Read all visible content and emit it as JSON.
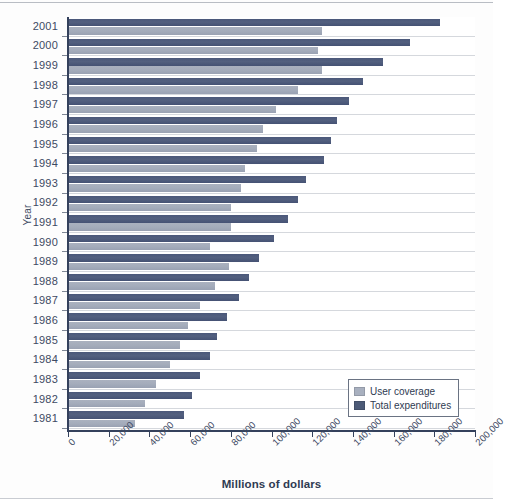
{
  "chart_data": {
    "type": "bar",
    "orientation": "horizontal",
    "title": "",
    "subtitle": "",
    "xlabel": "Millions of dollars",
    "ylabel": "Year",
    "xlim": [
      0,
      200000
    ],
    "ylim": null,
    "xticks": [
      0,
      20000,
      40000,
      60000,
      80000,
      100000,
      120000,
      140000,
      160000,
      180000,
      200000
    ],
    "xtick_labels": [
      "0",
      "20,000",
      "40,000",
      "60,000",
      "80,000",
      "100,000",
      "120,000",
      "140,000",
      "160,000",
      "180,000",
      "200,000"
    ],
    "grid": true,
    "grid_axis": "y",
    "legend_position": "bottom-right",
    "categories": [
      "2001",
      "2000",
      "1999",
      "1998",
      "1997",
      "1996",
      "1995",
      "1994",
      "1993",
      "1992",
      "1991",
      "1990",
      "1989",
      "1988",
      "1987",
      "1986",
      "1985",
      "1984",
      "1983",
      "1982",
      "1981"
    ],
    "series": [
      {
        "name": "Total expenditures",
        "color": "#4c5a77",
        "values": [
          183000,
          168000,
          155000,
          145000,
          138000,
          132000,
          129000,
          126000,
          117000,
          113000,
          108000,
          101000,
          94000,
          89000,
          84000,
          78000,
          73000,
          70000,
          65000,
          61000,
          57000
        ]
      },
      {
        "name": "User coverage",
        "color": "#a8b0bf",
        "values": [
          125000,
          123000,
          125000,
          113000,
          102000,
          96000,
          93000,
          87000,
          85000,
          80000,
          80000,
          70000,
          79000,
          72000,
          65000,
          59000,
          55000,
          50000,
          43000,
          38000,
          33000
        ]
      }
    ]
  },
  "legend": {
    "items": [
      {
        "label": "User coverage",
        "swatch": "user"
      },
      {
        "label": "Total expenditures",
        "swatch": "total"
      }
    ]
  },
  "axes": {
    "x_title": "Millions of dollars",
    "y_title": "Year"
  },
  "colors": {
    "total_expenditures": "#4c5a77",
    "user_coverage": "#a8b0bf",
    "axis": "#34415c",
    "grid": "#d5d8dd",
    "text": "#3d4a63"
  }
}
